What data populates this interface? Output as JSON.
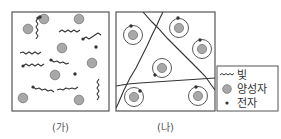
{
  "panels": [
    {
      "id": "ga",
      "caption": "(가)",
      "box": {
        "x": 12,
        "y": 12,
        "w": 97,
        "h": 99
      },
      "protons": [
        [
          28,
          29
        ],
        [
          44,
          19
        ],
        [
          79,
          19
        ],
        [
          62,
          48
        ],
        [
          92,
          63
        ],
        [
          55,
          75
        ],
        [
          23,
          98
        ],
        [
          79,
          100
        ]
      ],
      "electrons": [
        [
          40,
          17
        ],
        [
          96,
          47
        ],
        [
          75,
          74
        ]
      ],
      "photons": [
        {
          "path": "M38,18 l-2,3 2,3 -2,3 2,3 -2,3 2,3 -2,3",
          "dot": [
            38,
            18
          ]
        },
        {
          "path": "M59,32 l3,-2 3,2 3,-2 3,2 3,-2 3,2 3,-2",
          "dot": null
        },
        {
          "path": "M83,39 l3,-2 3,2 3,-2 3,-2 3,-2 3,2",
          "dot": [
            83,
            39
          ]
        },
        {
          "path": "M20,53 l3,-1 3,2 3,-2 3,2 3,-2 3,2 3,-2",
          "dot": null
        },
        {
          "path": "M23,66 l3,-2 3,2 3,-2 3,2 3,-2 3,2 3,-2",
          "dot": [
            23,
            66
          ]
        },
        {
          "path": "M51,60 l3,2 3,-1 3,2 3,-1 3,2 3,-1",
          "dot": [
            51,
            60
          ]
        },
        {
          "path": "M33,87 l3,2 3,-1 3,2 3,-1 3,2 3,-1 3,2",
          "dot": [
            33,
            87
          ]
        },
        {
          "path": "M57,90 l3,-1 3,1 3,-2 3,1 3,-1 3,1 3,-2",
          "dot": null
        },
        {
          "path": "M99,79 l-2,3 2,3 -2,3 2,3 -2,3 2,3 -2,3",
          "dot": null
        }
      ]
    },
    {
      "id": "na",
      "caption": "(나)",
      "box": {
        "x": 116,
        "y": 12,
        "w": 99,
        "h": 99
      },
      "atoms": [
        {
          "c": [
            133,
            35
          ],
          "e": [
            131,
            26
          ]
        },
        {
          "c": [
            179,
            28
          ],
          "e": [
            178,
            18
          ]
        },
        {
          "c": [
            202,
            49
          ],
          "e": [
            200,
            40
          ]
        },
        {
          "c": [
            162,
            68
          ],
          "e": [
            155,
            75
          ]
        },
        {
          "c": [
            134,
            97
          ],
          "e": [
            140,
            91
          ]
        },
        {
          "c": [
            198,
            96
          ],
          "e": [
            196,
            87
          ]
        }
      ],
      "photons": [
        "M143,12 L152,22 L158,28 L168,39 L177,48 L187,58 L197,68 L205,76 L212,86 L215,90",
        "M163,12 L160,18 L157,25 L152,35 L147,46 L141,58 L136,68 L130,78 L124,90 L118,104 L116,108",
        "M116,86 L128,84 L140,83 L155,82 L170,81 L185,80 L200,79 L215,78"
      ]
    }
  ],
  "legend": {
    "box": {
      "x": 217,
      "y": 66,
      "w": 61,
      "h": 45
    },
    "items": [
      {
        "icon": "wavy-line-icon",
        "label": "빛"
      },
      {
        "icon": "proton-circle-icon",
        "label": "양성자"
      },
      {
        "icon": "electron-dot-icon",
        "label": "전자"
      }
    ]
  },
  "colors": {
    "border": "#555555",
    "proton_fill": "#a8a8a8",
    "proton_stroke": "#777777",
    "electron": "#333333",
    "photon": "#333333",
    "orbit": "#444444"
  }
}
